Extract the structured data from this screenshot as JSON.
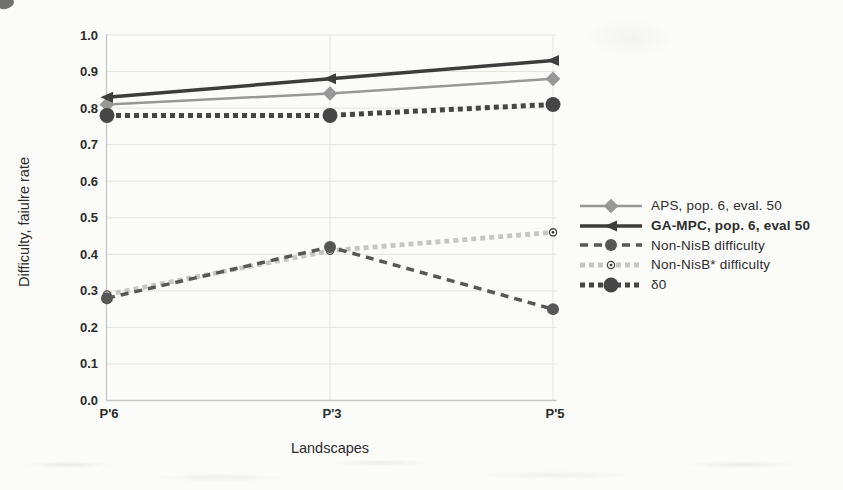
{
  "chart_data": {
    "type": "line",
    "title": "",
    "xlabel": "Landscapes",
    "ylabel": "Difficulty, faiulre rate",
    "categories": [
      "P'6",
      "P'3",
      "P'5"
    ],
    "ylim": [
      0.0,
      1.0
    ],
    "yticks": [
      "0.0",
      "0.1",
      "0.2",
      "0.3",
      "0.4",
      "0.5",
      "0.6",
      "0.7",
      "0.8",
      "0.9",
      "1.0"
    ],
    "grid": true,
    "legend_position": "right",
    "axis_color": "#c6c6c2",
    "grid_color": "#e3e3df",
    "text_color": "#2c2c2c",
    "series": [
      {
        "name": "APS, pop. 6, eval. 50",
        "values": [
          0.81,
          0.84,
          0.88
        ],
        "color": "#979797",
        "line_style": "solid",
        "marker": "diamond",
        "bold_label": false
      },
      {
        "name": "GA-MPC, pop. 6, eval 50",
        "values": [
          0.83,
          0.88,
          0.93
        ],
        "color": "#3d3d3d",
        "line_style": "solid",
        "marker": "triangle-left",
        "bold_label": true
      },
      {
        "name": "Non-NisB difficulty",
        "values": [
          0.28,
          0.42,
          0.25
        ],
        "color": "#575757",
        "line_style": "dashed",
        "marker": "circle",
        "bold_label": false
      },
      {
        "name": "Non-NisB* difficulty",
        "values": [
          0.29,
          0.41,
          0.46
        ],
        "color": "#c6c6c3",
        "line_style": "square-dash",
        "marker": "open-circle",
        "bold_label": false
      },
      {
        "name": "δ0",
        "values": [
          0.78,
          0.78,
          0.81
        ],
        "color": "#464646",
        "line_style": "square-dash",
        "marker": "large-circle",
        "bold_label": false
      }
    ]
  }
}
